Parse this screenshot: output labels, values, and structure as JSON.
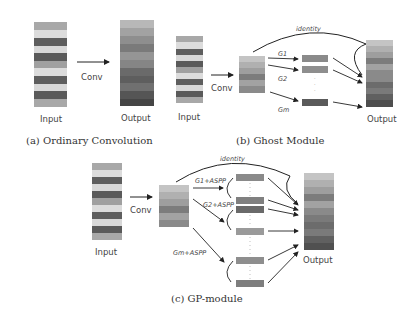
{
  "panels": {
    "a": {
      "caption": "(a) Ordinary Convolution",
      "input_label": "Input",
      "op_label": "Conv",
      "output_label": "Output"
    },
    "b": {
      "caption": "(b) Ghost Module",
      "input_label": "Input",
      "op_label": "Conv",
      "identity_label": "identity",
      "ops": [
        "G1",
        "G2",
        "Gm"
      ],
      "output_label": "Output"
    },
    "c": {
      "caption": "(c) GP-module",
      "input_label": "Input",
      "op_label": "Conv",
      "identity_label": "identity",
      "ops": [
        "G1+ASPP",
        "G2+ASPP",
        "Gm+ASPP"
      ],
      "output_label": "Output"
    }
  },
  "colors": {
    "light": "#d9d9d9",
    "mid": "#a6a6a6",
    "dark": "#595959",
    "line": "#222222"
  }
}
